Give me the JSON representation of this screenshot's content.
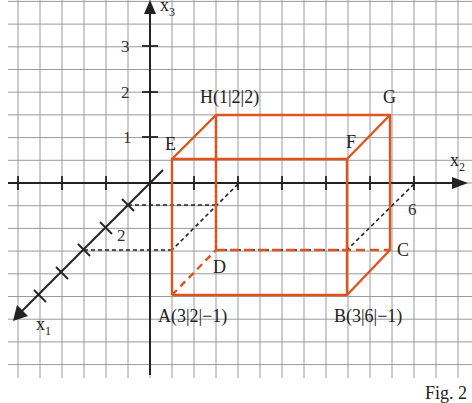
{
  "figure": {
    "caption": "Fig. 2",
    "colors": {
      "grid": "#9a9a9a",
      "axis": "#222222",
      "edge": "#e0531f",
      "helper_dash": "#222222",
      "background": "#ffffff"
    }
  },
  "axes": {
    "x1": {
      "name": "x",
      "sub": "1",
      "tick_label": "2"
    },
    "x2": {
      "name": "x",
      "sub": "2",
      "tick_label": "6"
    },
    "x3": {
      "name": "x",
      "sub": "3",
      "tick_labels": [
        "1",
        "2",
        "3"
      ]
    }
  },
  "points": {
    "A": {
      "label": "A",
      "coords": "(3|2|−1)",
      "display": "A(3|2|−1)"
    },
    "B": {
      "label": "B",
      "coords": "(3|6|−1)",
      "display": "B(3|6|−1)"
    },
    "C": {
      "label": "C",
      "display": "C"
    },
    "D": {
      "label": "D",
      "display": "D"
    },
    "E": {
      "label": "E",
      "display": "E"
    },
    "F": {
      "label": "F",
      "display": "F"
    },
    "G": {
      "label": "G",
      "display": "G"
    },
    "H": {
      "label": "H",
      "coords": "(1|2|2)",
      "display": "H(1|2|2)"
    }
  },
  "shape": {
    "type": "cuboid",
    "vertices": [
      "A",
      "B",
      "C",
      "D",
      "E",
      "F",
      "G",
      "H"
    ],
    "hidden_edges": [
      "A-D",
      "D-C",
      "D-H"
    ]
  }
}
